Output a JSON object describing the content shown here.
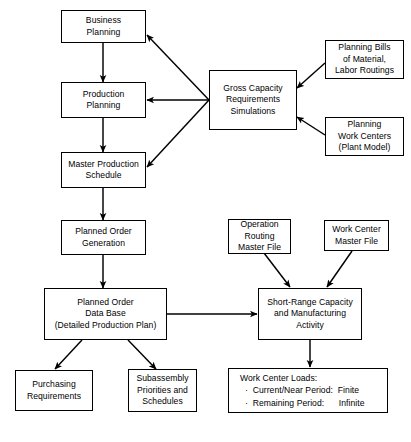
{
  "diagram": {
    "background_color": "#ffffff",
    "line_color": "#000000",
    "nodes": [
      {
        "id": "business-planning",
        "label": "Business\nPlanning"
      },
      {
        "id": "production-planning",
        "label": "Production\nPlanning"
      },
      {
        "id": "master-production-schedule",
        "label": "Master Production\nSchedule"
      },
      {
        "id": "planned-order-generation",
        "label": "Planned Order\nGeneration"
      },
      {
        "id": "planned-order-data-base",
        "label": "Planned Order\nData Base\n(Detailed Production Plan)"
      },
      {
        "id": "gross-capacity",
        "label": "Gross Capacity\nRequirements\nSimulations"
      },
      {
        "id": "planning-bills",
        "label": "Planning Bills\nof Material,\nLabor Routings"
      },
      {
        "id": "planning-work-centers",
        "label": "Planning\nWork Centers\n(Plant Model)"
      },
      {
        "id": "operation-routing-master-file",
        "label": "Operation\nRouting\nMaster File"
      },
      {
        "id": "work-center-master-file",
        "label": "Work Center\nMaster File"
      },
      {
        "id": "short-range-capacity",
        "label": "Short-Range Capacity\nand Manufacturing\nActivity"
      },
      {
        "id": "purchasing-requirements",
        "label": "Purchasing\nRequirements"
      },
      {
        "id": "subassembly-priorities",
        "label": "Subassembly\nPriorities and\nSchedules"
      },
      {
        "id": "work-center-loads",
        "label": "Work Center Loads:\n  ·  Current/Near Period:  Finite\n  ·  Remaining Period:      Infinite"
      }
    ]
  }
}
